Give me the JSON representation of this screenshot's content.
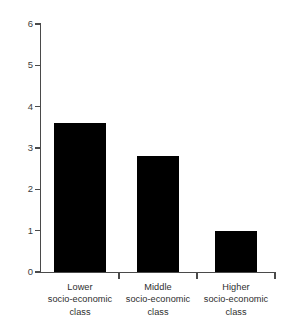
{
  "chart_data": {
    "type": "bar",
    "title": "",
    "xlabel": "",
    "ylabel": "",
    "categories": [
      "Lower socio-economic class",
      "Middle socio-economic class",
      "Higher socio-economic class"
    ],
    "category_lines": [
      [
        "Lower",
        "socio-economic",
        "class"
      ],
      [
        "Middle",
        "socio-economic",
        "class"
      ],
      [
        "Higher",
        "socio-economic",
        "class"
      ]
    ],
    "values": [
      3.6,
      2.8,
      1.0
    ],
    "ylim": [
      0,
      6
    ],
    "ytick_labels": [
      "0",
      "1",
      "2",
      "3",
      "4",
      "5",
      "6"
    ],
    "ytick_values": [
      0,
      1,
      2,
      3,
      4,
      5,
      6
    ],
    "grid": false,
    "legend": "none",
    "bar_color": "#000000",
    "axis_color": "#4a4a4a",
    "background_color": "#ffffff"
  }
}
